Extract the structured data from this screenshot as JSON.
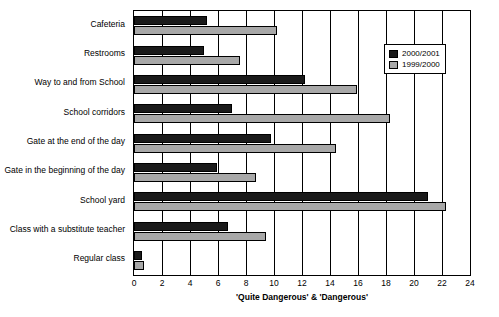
{
  "chart_data": {
    "type": "bar",
    "orientation": "horizontal",
    "title": "",
    "xlabel": "'Quite Dangerous' & 'Dangerous'",
    "ylabel": "",
    "xlim": [
      0,
      24
    ],
    "xticks": [
      "0",
      "2",
      "4",
      "6",
      "8",
      "10",
      "12",
      "14",
      "16",
      "18",
      "20",
      "22",
      "24"
    ],
    "grid": true,
    "legend_position": "top-right",
    "categories": [
      "Cafeteria",
      "Restrooms",
      "Way to and from School",
      "School corridors",
      "Gate at the end of the day",
      "Gate in the beginning of the day",
      "School yard",
      "Class with a substitute teacher",
      "Regular class"
    ],
    "series": [
      {
        "name": "2000/2001",
        "color": "#1a1a1a",
        "values": [
          5.2,
          5.0,
          12.2,
          7.0,
          9.8,
          5.9,
          21.0,
          6.7,
          0.6
        ]
      },
      {
        "name": "1999/2000",
        "color": "#a8a8a8",
        "values": [
          10.2,
          7.6,
          15.9,
          18.3,
          14.4,
          8.7,
          22.3,
          9.4,
          0.7
        ]
      }
    ]
  }
}
